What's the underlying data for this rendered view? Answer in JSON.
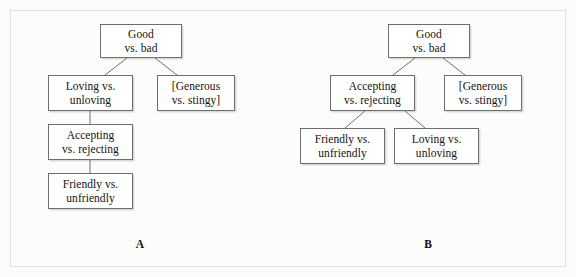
{
  "figure": {
    "background_color": "#fbfbfa",
    "frame_color": "#e2e1de",
    "box_border_color": "#6e6e6e",
    "box_fill_color": "#ffffff",
    "connector_color": "#6e6e6e",
    "text_color": "#15120f"
  },
  "panels": [
    {
      "id": "A",
      "label": "A",
      "nodes": [
        {
          "id": "a-good",
          "line1": "Good",
          "line2": "vs. bad"
        },
        {
          "id": "a-loving",
          "line1": "Loving vs.",
          "line2": "unloving"
        },
        {
          "id": "a-generous",
          "line1": "[Generous",
          "line2": "vs. stingy]"
        },
        {
          "id": "a-accepting",
          "line1": "Accepting",
          "line2": "vs. rejecting"
        },
        {
          "id": "a-friendly",
          "line1": "Friendly vs.",
          "line2": "unfriendly"
        }
      ],
      "edges": [
        {
          "from": "a-good",
          "to": "a-loving"
        },
        {
          "from": "a-good",
          "to": "a-generous"
        },
        {
          "from": "a-loving",
          "to": "a-accepting"
        },
        {
          "from": "a-accepting",
          "to": "a-friendly"
        }
      ]
    },
    {
      "id": "B",
      "label": "B",
      "nodes": [
        {
          "id": "b-good",
          "line1": "Good",
          "line2": "vs. bad"
        },
        {
          "id": "b-accepting",
          "line1": "Accepting",
          "line2": "vs. rejecting"
        },
        {
          "id": "b-generous",
          "line1": "[Generous",
          "line2": "vs. stingy]"
        },
        {
          "id": "b-friendly",
          "line1": "Friendly vs.",
          "line2": "unfriendly"
        },
        {
          "id": "b-loving",
          "line1": "Loving vs.",
          "line2": "unloving"
        }
      ],
      "edges": [
        {
          "from": "b-good",
          "to": "b-accepting"
        },
        {
          "from": "b-good",
          "to": "b-generous"
        },
        {
          "from": "b-accepting",
          "to": "b-friendly"
        },
        {
          "from": "b-accepting",
          "to": "b-loving"
        }
      ]
    }
  ]
}
